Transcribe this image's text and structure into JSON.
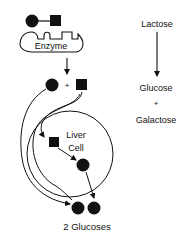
{
  "left_panel": {
    "enzyme_label": "Enzyme",
    "plus_sign": "+",
    "liver_cell_line1": "Liver",
    "liver_cell_line2": "Cell",
    "result_label": "2 Glucoses"
  },
  "right_panel": {
    "reactant": "Lactose",
    "product1": "Glucose",
    "plus_sign": "+",
    "product2": "Galactose"
  },
  "colors": {
    "ink": "#111111",
    "background": "#ffffff"
  }
}
